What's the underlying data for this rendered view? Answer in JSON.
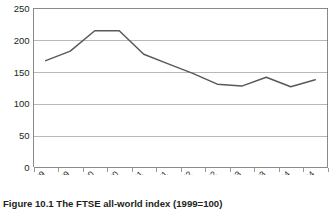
{
  "caption": {
    "text": "Figure 10.1  The FTSE all-world index (1999=100)"
  },
  "chart_data": {
    "type": "line",
    "title": "",
    "subtitle": "",
    "xlabel": "",
    "ylabel": "",
    "categories": [
      "Jan 99",
      "July 99",
      "Jan 00",
      "July 00",
      "Jan 01",
      "July 01",
      "Jan 02",
      "July 02",
      "Jan 03",
      "July 03",
      "Jan 04",
      "July 04"
    ],
    "series": [
      {
        "name": "FTSE all-world index",
        "color": "#595959",
        "values": [
          168,
          183,
          215,
          215,
          178,
          163,
          148,
          131,
          128,
          142,
          127,
          138
        ]
      }
    ],
    "ylim": [
      0,
      250
    ],
    "yticks": [
      0,
      50,
      100,
      150,
      200,
      250
    ],
    "ytick_labels": [
      "0",
      "50",
      "100",
      "150",
      "200",
      "250"
    ],
    "grid": "horizontal",
    "legend": "none",
    "xtick_rotation": 45
  },
  "colors": {
    "line": "#595959",
    "gridline": "#9a9a9a",
    "axis": "#6d6d6d",
    "text": "#231f20",
    "background": "#ffffff"
  }
}
